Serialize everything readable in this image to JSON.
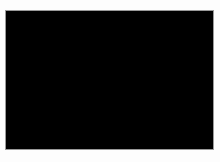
{
  "figure": {
    "kind": "molecular-space-filling-model",
    "caption": "",
    "page_background": "#fdfdfd",
    "canvas": {
      "x": 5,
      "y": 10,
      "width": 207,
      "height": 138,
      "background_color": "#000000",
      "border_color": "#9a9a9a",
      "border_width": 1
    },
    "render": {
      "style": "cpk-spacefill",
      "shading": "diffuse-specular",
      "color_mode": "grayscale",
      "light_direction": "upper-left",
      "ambient": 0.1,
      "specular_strength": 0.55,
      "base_gray_min": "#1a1a1a",
      "base_gray_max": "#e8e8e8",
      "highlight_color": "#ffffff",
      "edge_falloff": 0.92,
      "blur_px": 0.6
    },
    "molecule": {
      "name": "",
      "bounds": {
        "x_min": 18,
        "x_max": 202,
        "y_min": 42,
        "y_max": 110
      },
      "atom_count": 168,
      "axis_tilt_deg": -4,
      "backbone_points": [
        {
          "x": 26,
          "y": 74
        },
        {
          "x": 48,
          "y": 68
        },
        {
          "x": 72,
          "y": 72
        },
        {
          "x": 96,
          "y": 70
        },
        {
          "x": 120,
          "y": 74
        },
        {
          "x": 146,
          "y": 70
        },
        {
          "x": 172,
          "y": 72
        },
        {
          "x": 196,
          "y": 70
        }
      ],
      "clusters": [
        {
          "cx": 30,
          "cy": 72,
          "rx": 17,
          "ry": 19,
          "density": 22,
          "brightness": 0.72
        },
        {
          "cx": 56,
          "cy": 66,
          "rx": 19,
          "ry": 20,
          "density": 26,
          "brightness": 0.86
        },
        {
          "cx": 80,
          "cy": 74,
          "rx": 18,
          "ry": 21,
          "density": 24,
          "brightness": 0.7
        },
        {
          "cx": 104,
          "cy": 68,
          "rx": 19,
          "ry": 22,
          "density": 27,
          "brightness": 0.9
        },
        {
          "cx": 128,
          "cy": 76,
          "rx": 18,
          "ry": 20,
          "density": 24,
          "brightness": 0.74
        },
        {
          "cx": 152,
          "cy": 68,
          "rx": 19,
          "ry": 21,
          "density": 26,
          "brightness": 0.88
        },
        {
          "cx": 176,
          "cy": 72,
          "rx": 17,
          "ry": 19,
          "density": 22,
          "brightness": 0.76
        },
        {
          "cx": 196,
          "cy": 70,
          "rx": 11,
          "ry": 13,
          "density": 12,
          "brightness": 0.68
        },
        {
          "cx": 108,
          "cy": 96,
          "rx": 11,
          "ry": 9,
          "density": 9,
          "brightness": 0.52
        },
        {
          "cx": 64,
          "cy": 90,
          "rx": 10,
          "ry": 8,
          "density": 7,
          "brightness": 0.46
        },
        {
          "cx": 160,
          "cy": 88,
          "rx": 9,
          "ry": 8,
          "density": 6,
          "brightness": 0.5
        }
      ],
      "atom_radius_px": {
        "min": 4.2,
        "max": 7.6
      },
      "random_seed": 20240517
    }
  }
}
